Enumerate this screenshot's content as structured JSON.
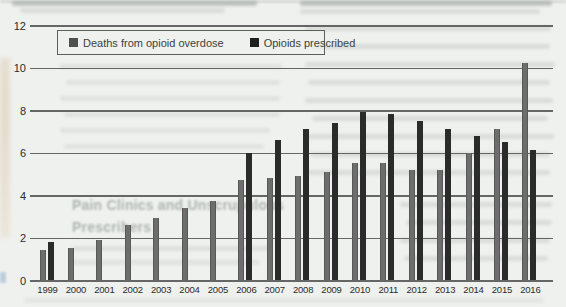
{
  "chart_data": {
    "type": "bar",
    "title": "",
    "categories": [
      "1999",
      "2000",
      "2001",
      "2002",
      "2003",
      "2004",
      "2005",
      "2006",
      "2007",
      "2008",
      "2009",
      "2010",
      "2011",
      "2012",
      "2013",
      "2014",
      "2015",
      "2016"
    ],
    "series": [
      {
        "name": "Deaths from opioid overdose",
        "color": "#6d6d6d",
        "values": [
          1.4,
          1.5,
          1.9,
          2.6,
          2.9,
          3.4,
          3.7,
          4.7,
          4.8,
          4.9,
          5.1,
          5.5,
          5.5,
          5.2,
          5.2,
          6.0,
          7.1,
          10.2
        ]
      },
      {
        "name": "Opioids prescribed",
        "color": "#2b2b2b",
        "values": [
          1.8,
          null,
          null,
          null,
          null,
          null,
          null,
          6.0,
          6.6,
          7.1,
          7.4,
          7.9,
          7.8,
          7.5,
          7.1,
          6.8,
          6.5,
          6.1
        ]
      }
    ],
    "xlabel": "",
    "ylabel": "",
    "ylim": [
      0,
      12
    ],
    "yticks": [
      0,
      2,
      4,
      6,
      8,
      10,
      12
    ],
    "grid": true,
    "legend_position": "top-left"
  },
  "legend": {
    "items": [
      {
        "label": "Deaths from opioid overdose",
        "swatch_color": "#4f4f4f"
      },
      {
        "label": "Opioids prescribed",
        "swatch_color": "#1f1f1f"
      }
    ]
  },
  "background": {
    "bleed_heading_line1": "Pain Clinics and Unscrupulous",
    "bleed_heading_line2": "Prescribers",
    "paper_color": "#eff1ee",
    "gridline_color": "#4d4d4d"
  }
}
